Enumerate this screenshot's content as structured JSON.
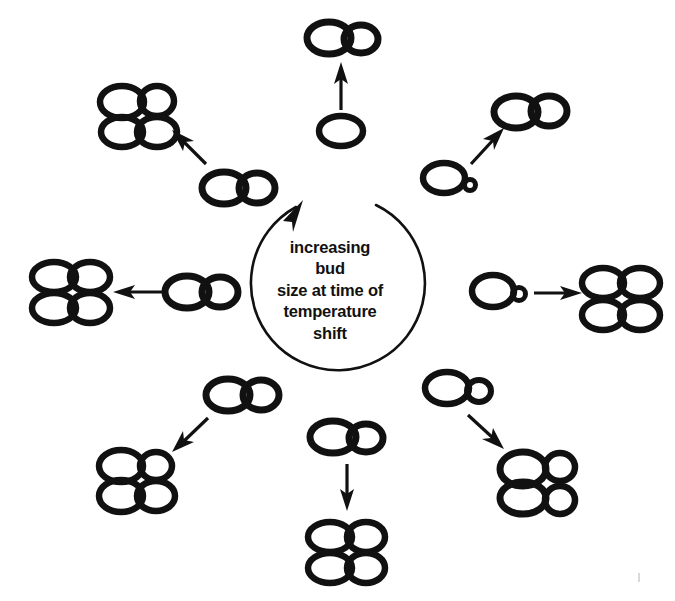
{
  "figure": {
    "width": 675,
    "height": 601,
    "background": "#ffffff",
    "ink_color": "#111111",
    "type": "schematic-diagram"
  },
  "center": {
    "caption_lines": [
      "increasing",
      "bud",
      "size at time of",
      "temperature",
      "shift"
    ],
    "caption_full": "increasing bud size at time of temperature shift",
    "arrow_direction": "counterclockwise",
    "arrowhead_position": "top-left"
  },
  "stages": [
    {
      "id": "stage-top",
      "position": "top",
      "angle_deg": 90,
      "source_label": "unbudded cell",
      "source_bud_size": "none",
      "arrow_label": "arrow-up",
      "arrow_direction": "up",
      "result_label": "mother cell with large bud",
      "result_cell_count": 2
    },
    {
      "id": "stage-upper-right",
      "position": "upper-right",
      "angle_deg": 45,
      "source_label": "cell with tiny bud",
      "source_bud_size": "tiny",
      "arrow_label": "arrow-up-right",
      "arrow_direction": "up-right",
      "result_label": "mother cell with large bud",
      "result_cell_count": 2
    },
    {
      "id": "stage-right",
      "position": "right",
      "angle_deg": 0,
      "source_label": "cell with small bud",
      "source_bud_size": "small",
      "arrow_label": "arrow-right",
      "arrow_direction": "right",
      "result_label": "four-cell cluster",
      "result_cell_count": 4
    },
    {
      "id": "stage-lower-right",
      "position": "lower-right",
      "angle_deg": -45,
      "source_label": "cell with medium bud",
      "source_bud_size": "medium",
      "arrow_label": "arrow-down-right",
      "arrow_direction": "down-right",
      "result_label": "four-cell cluster with small buds",
      "result_cell_count": 4
    },
    {
      "id": "stage-bottom",
      "position": "bottom",
      "angle_deg": -90,
      "source_label": "cell with large bud",
      "source_bud_size": "large",
      "arrow_label": "arrow-down",
      "arrow_direction": "down",
      "result_label": "four-cell cluster",
      "result_cell_count": 4
    },
    {
      "id": "stage-lower-left",
      "position": "lower-left",
      "angle_deg": -135,
      "source_label": "cell with large bud",
      "source_bud_size": "large",
      "arrow_label": "arrow-down-left",
      "arrow_direction": "down-left",
      "result_label": "four-cell cluster",
      "result_cell_count": 4
    },
    {
      "id": "stage-left",
      "position": "left",
      "angle_deg": 180,
      "source_label": "cell with large bud",
      "source_bud_size": "large",
      "arrow_label": "arrow-left",
      "arrow_direction": "left",
      "result_label": "four-cell cluster",
      "result_cell_count": 4
    },
    {
      "id": "stage-upper-left",
      "position": "upper-left",
      "angle_deg": 135,
      "source_label": "cell with large bud",
      "source_bud_size": "large",
      "arrow_label": "arrow-up-left",
      "arrow_direction": "up-left",
      "result_label": "four-cell cluster",
      "result_cell_count": 4
    }
  ]
}
